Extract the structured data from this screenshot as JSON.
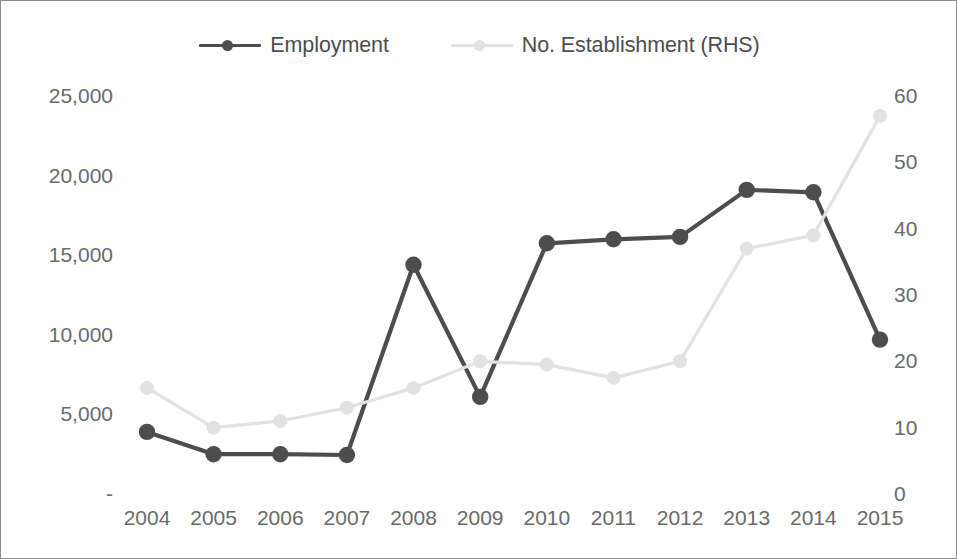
{
  "figure": {
    "background_color": "#ffffff",
    "border_color": "#8d8d8d"
  },
  "legend": {
    "position": "top-center",
    "items": [
      {
        "label": "Employment",
        "color": "#4d4d4d",
        "marker": "circle"
      },
      {
        "label": "No. Establishment (RHS)",
        "color": "#e2e2e2",
        "marker": "circle"
      }
    ]
  },
  "axes": {
    "left": {
      "tick_labels": [
        "25,000",
        "20,000",
        "15,000",
        "10,000",
        "5,000",
        "-"
      ],
      "tick_values": [
        25000,
        20000,
        15000,
        10000,
        5000,
        0
      ],
      "min": 0,
      "max": 25000
    },
    "right": {
      "tick_labels": [
        "60",
        "50",
        "40",
        "30",
        "20",
        "10",
        "0"
      ],
      "tick_values": [
        60,
        50,
        40,
        30,
        20,
        10,
        0
      ],
      "min": 0,
      "max": 60
    },
    "bottom": {
      "tick_labels": [
        "2004",
        "2005",
        "2006",
        "2007",
        "2008",
        "2009",
        "2010",
        "2011",
        "2012",
        "2013",
        "2014",
        "2015"
      ]
    }
  },
  "chart_data": {
    "type": "line",
    "title": "",
    "xlabel": "",
    "ylabel": "",
    "categories": [
      "2004",
      "2005",
      "2006",
      "2007",
      "2008",
      "2009",
      "2010",
      "2011",
      "2012",
      "2013",
      "2014",
      "2015"
    ],
    "grid": false,
    "legend_position": "top-center",
    "series": [
      {
        "name": "Employment",
        "axis": "left",
        "color": "#4d4d4d",
        "marker": "circle",
        "ylim": [
          0,
          25000
        ],
        "values": [
          3900,
          2500,
          2500,
          2450,
          14400,
          6100,
          15750,
          16000,
          16150,
          19100,
          18950,
          9700
        ]
      },
      {
        "name": "No. Establishment (RHS)",
        "axis": "right",
        "color": "#e2e2e2",
        "marker": "circle",
        "ylim": [
          0,
          60
        ],
        "values": [
          16,
          10,
          11,
          13,
          16,
          20,
          19.5,
          17.5,
          20,
          37,
          39,
          57
        ]
      }
    ]
  }
}
